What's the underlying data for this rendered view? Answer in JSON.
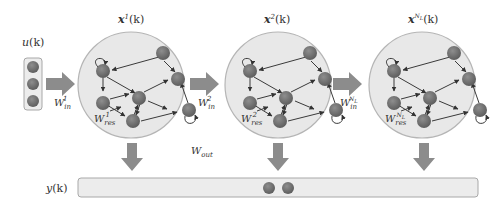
{
  "diagram": {
    "type": "deep-echo-state-network",
    "input": {
      "label": "u(k)",
      "label_base": "u",
      "label_arg": "(k)",
      "node_count": 3
    },
    "input_weights": [
      {
        "label": "W",
        "sub": "in",
        "sup": "1"
      },
      {
        "label": "W",
        "sub": "in",
        "sup": "2"
      },
      {
        "label": "W",
        "sub": "in",
        "sup": "NL"
      }
    ],
    "reservoirs": [
      {
        "state_label": "x",
        "state_sup": "1",
        "state_arg": "(k)",
        "weight_label": "W",
        "weight_sub": "res",
        "weight_sup": "1"
      },
      {
        "state_label": "x",
        "state_sup": "2",
        "state_arg": "(k)",
        "weight_label": "W",
        "weight_sub": "res",
        "weight_sup": "2"
      },
      {
        "state_label": "x",
        "state_sup": "NL",
        "state_arg": "(k)",
        "weight_label": "W",
        "weight_sub": "res",
        "weight_sup": "NL"
      }
    ],
    "output_weights": {
      "label": "W",
      "sub": "out"
    },
    "output": {
      "label": "y(k)",
      "label_base": "y",
      "label_arg": "(k)",
      "node_count": 2
    },
    "colors": {
      "node": "#7a7a7a",
      "reservoir_fill": "#e8e8e8",
      "reservoir_stroke": "#b5b5b5",
      "arrow": "#8c8c8c",
      "edge": "#3a3a3a",
      "bar_fill": "#ececec"
    }
  }
}
